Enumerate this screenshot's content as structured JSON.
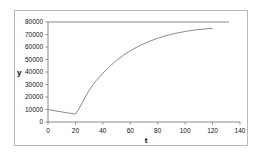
{
  "chart_data": {
    "type": "line",
    "title": "",
    "subtitle": "",
    "xlabel": "t",
    "ylabel": "y",
    "xlim": [
      0,
      140
    ],
    "ylim": [
      0,
      80000
    ],
    "xticks": [
      0,
      20,
      40,
      60,
      80,
      100,
      120,
      140
    ],
    "xtick_labels": [
      "0",
      "20",
      "40",
      "60",
      "80",
      "100",
      "120",
      "140"
    ],
    "yticks": [
      0,
      10000,
      20000,
      30000,
      40000,
      50000,
      60000,
      70000,
      80000
    ],
    "ytick_labels": [
      "0",
      "10000",
      "20000",
      "30000",
      "40000",
      "50000",
      "60000",
      "70000",
      "80000"
    ],
    "grid": false,
    "legend": null,
    "series": [
      {
        "name": "carrying-capacity",
        "style": "horizontal-asymptote",
        "color": "#8a8a8a",
        "x": [
          0,
          132
        ],
        "values": [
          80000,
          80000
        ]
      },
      {
        "name": "population",
        "style": "solid",
        "color": "#8a8a8a",
        "x": [
          0,
          5,
          10,
          15,
          20,
          22,
          25,
          28,
          30,
          35,
          40,
          45,
          50,
          55,
          60,
          65,
          70,
          75,
          80,
          85,
          90,
          95,
          100,
          105,
          110,
          115,
          120
        ],
        "values": [
          10000,
          9000,
          8100,
          7200,
          6300,
          9500,
          15500,
          21500,
          25500,
          33000,
          39000,
          44500,
          49300,
          53400,
          57000,
          60000,
          62700,
          65000,
          67000,
          68700,
          70200,
          71400,
          72400,
          73300,
          74000,
          74500,
          74800
        ]
      }
    ],
    "annotations": []
  },
  "axes": {
    "x_axis_name": "t",
    "y_axis_name": "y"
  },
  "colors": {
    "frame": "#b9b9b9",
    "axis": "#8a8a8a",
    "curve": "#8a8a8a",
    "text": "#111111",
    "background": "#ffffff"
  }
}
